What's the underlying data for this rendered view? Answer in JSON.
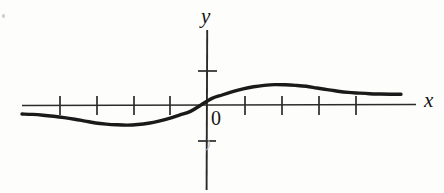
{
  "figure": {
    "labels": {
      "y_axis": "y",
      "x_axis": "x",
      "origin": "0",
      "scan_artifact": ")"
    },
    "colors": {
      "curve": "#1a1a1a",
      "axis": "#262626",
      "background": "#fdfdfc"
    }
  },
  "chart_data": {
    "type": "line",
    "title": "",
    "subtitle": "",
    "xlabel": "x",
    "ylabel": "y",
    "origin_label": "0",
    "grid": false,
    "legend": null,
    "axis": {
      "x_axis_y_pixel": 105,
      "y_axis_x_pixel": 207,
      "x_axis_from_px": 22,
      "x_axis_to_px": 416,
      "y_axis_from_px": 30,
      "y_axis_to_px": 190,
      "x_tick_spacing_px": 37
    },
    "x_ticks": [
      -4,
      -3,
      -2,
      -1,
      1,
      2,
      3,
      4
    ],
    "x_tick_pixels": [
      60,
      97,
      134,
      170,
      245,
      282,
      319,
      356
    ],
    "y_ticks": [
      1,
      -1
    ],
    "y_tick_pixels": [
      71,
      141
    ],
    "xlim": [
      -5,
      5.6
    ],
    "ylim": [
      -2.15,
      2.15
    ],
    "annotations": [
      {
        "text": "local minimum",
        "x": -1.4,
        "y": -0.57
      },
      {
        "text": "inflection at origin",
        "x": 0,
        "y": 0
      },
      {
        "text": "local maximum",
        "x": 1.7,
        "y": 0.6
      }
    ],
    "series": [
      {
        "name": "f(x)",
        "x": [
          -5.0,
          -4.6,
          -4.2,
          -3.8,
          -3.4,
          -3.0,
          -2.6,
          -2.2,
          -1.9,
          -1.6,
          -1.4,
          -1.2,
          -1.0,
          -0.8,
          -0.6,
          -0.4,
          -0.2,
          0.0,
          0.2,
          0.4,
          0.6,
          0.8,
          1.0,
          1.2,
          1.4,
          1.6,
          1.8,
          2.0,
          2.3,
          2.6,
          3.0,
          3.4,
          3.8,
          4.2,
          4.6,
          5.0,
          5.4
        ],
        "y": [
          -0.24,
          -0.25,
          -0.27,
          -0.3,
          -0.34,
          -0.39,
          -0.46,
          -0.53,
          -0.57,
          -0.59,
          -0.6,
          -0.58,
          -0.54,
          -0.47,
          -0.37,
          -0.25,
          -0.13,
          0.0,
          0.13,
          0.25,
          0.37,
          0.47,
          0.55,
          0.59,
          0.61,
          0.6,
          0.58,
          0.55,
          0.49,
          0.44,
          0.39,
          0.35,
          0.33,
          0.31,
          0.3,
          0.29,
          0.29
        ],
        "y_pixels": [
          114.0,
          114.4,
          115.2,
          116.3,
          117.6,
          119.2,
          121.1,
          123.0,
          124.1,
          124.8,
          125.1,
          124.5,
          123.2,
          121.1,
          118.3,
          114.9,
          111.4,
          105.0,
          98.6,
          95.0,
          91.7,
          88.9,
          86.8,
          85.4,
          84.6,
          84.8,
          85.4,
          86.3,
          88.0,
          89.6,
          91.2,
          92.4,
          93.1,
          93.7,
          94.0,
          94.2,
          94.3
        ],
        "stroke_px": 3.4,
        "color": "#1a1a1a"
      }
    ]
  }
}
